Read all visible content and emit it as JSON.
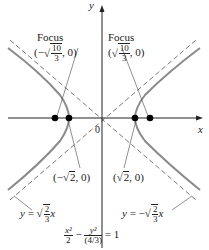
{
  "figure": {
    "axes": {
      "x_label": "x",
      "y_label": "y",
      "origin_label": "0"
    },
    "foci": [
      {
        "label": "Focus",
        "coord_prefix": "(−",
        "num": "10",
        "den": "3",
        "coord_suffix": ", 0)"
      },
      {
        "label": "Focus",
        "coord_prefix": "(",
        "num": "10",
        "den": "3",
        "coord_suffix": ", 0)"
      }
    ],
    "vertices": [
      {
        "prefix": "(−",
        "rad": "2",
        "suffix": ", 0)"
      },
      {
        "prefix": "(",
        "rad": "2",
        "suffix": ", 0)"
      }
    ],
    "asymptotes": [
      {
        "lhs": "y",
        "eq": " = ",
        "sign": "",
        "num": "2",
        "den": "3",
        "var": "x"
      },
      {
        "lhs": "y",
        "eq": " = ",
        "sign": "−",
        "num": "2",
        "den": "3",
        "var": "x"
      }
    ],
    "equation": {
      "t1_num": "x²",
      "t1_den": "2",
      "minus": "−",
      "t2_num": "y²",
      "t2_den": "(4/3)",
      "eq": "= 1"
    },
    "colors": {
      "curve": "#8a8a8a",
      "axis": "#222222",
      "dash": "#555555",
      "point": "#000000"
    }
  }
}
